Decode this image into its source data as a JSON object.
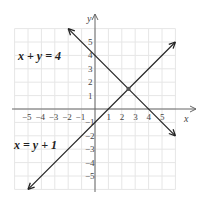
{
  "chart_data": {
    "type": "line",
    "title": "",
    "xlabel": "x",
    "ylabel": "y",
    "xlim": [
      -6,
      6
    ],
    "ylim": [
      -6,
      6
    ],
    "grid": true,
    "x_ticks": [
      "-5",
      "-4",
      "-3",
      "-2",
      "-1",
      "1",
      "2",
      "3",
      "4",
      "5"
    ],
    "y_ticks": [
      "5",
      "4",
      "3",
      "2",
      "1",
      "-1",
      "-2",
      "-3",
      "-4",
      "-5"
    ],
    "series": [
      {
        "name": "x + y = 4",
        "equation": "x + y = 4",
        "points": [
          [
            -2,
            6
          ],
          [
            0,
            4
          ],
          [
            4,
            0
          ],
          [
            6,
            -2
          ]
        ]
      },
      {
        "name": "x = y + 1",
        "equation": "x = y + 1",
        "points": [
          [
            -5,
            -6
          ],
          [
            0,
            -1
          ],
          [
            1,
            0
          ],
          [
            6,
            5
          ]
        ]
      }
    ],
    "annotations": [
      {
        "type": "point",
        "label": "intersection",
        "x": 2.5,
        "y": 1.5
      }
    ]
  },
  "labels": {
    "eq1": "x + y = 4",
    "eq2": "x = y + 1",
    "x_axis": "x",
    "y_axis": "y"
  }
}
